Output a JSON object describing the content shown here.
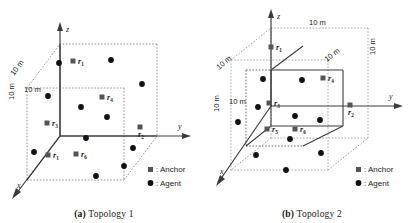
{
  "figure": {
    "panels": [
      {
        "id": "a",
        "caption_tag": "(a)",
        "caption_text": "Topology 1",
        "axes": {
          "x": "x",
          "y": "y",
          "z": "z"
        },
        "dimension_labels": [
          "10 m",
          "10 m",
          "10 m"
        ],
        "legend": {
          "anchor_label": ": Anchor",
          "agent_label": ": Agent"
        },
        "anchors": [
          {
            "name": "r",
            "sub": "1",
            "x": 74,
            "y": 62
          },
          {
            "name": "r",
            "sub": "2",
            "x": 141,
            "y": 128
          },
          {
            "name": "r",
            "sub": "3",
            "x": 48,
            "y": 124
          },
          {
            "name": "r",
            "sub": "4",
            "x": 103,
            "y": 98
          },
          {
            "name": "r",
            "sub": "6",
            "x": 77,
            "y": 155
          },
          {
            "name": "r",
            "sub": "1",
            "x": 49,
            "y": 156
          }
        ],
        "agents": [
          {
            "x": 59,
            "y": 63
          },
          {
            "x": 111,
            "y": 60
          },
          {
            "x": 142,
            "y": 84
          },
          {
            "x": 48,
            "y": 96
          },
          {
            "x": 81,
            "y": 107
          },
          {
            "x": 107,
            "y": 117
          },
          {
            "x": 86,
            "y": 138
          },
          {
            "x": 133,
            "y": 148
          },
          {
            "x": 34,
            "y": 152
          },
          {
            "x": 124,
            "y": 166
          },
          {
            "x": 96,
            "y": 176
          }
        ]
      },
      {
        "id": "b",
        "caption_tag": "(b)",
        "caption_text": "Topology 2",
        "axes": {
          "x": "x",
          "y": "y",
          "z": "z"
        },
        "dimension_labels": [
          "10 m",
          "10 m",
          "10 m",
          "10 m",
          "10 m",
          "10 m"
        ],
        "legend": {
          "anchor_label": ": Anchor",
          "agent_label": ": Agent"
        },
        "anchors": [
          {
            "name": "r",
            "sub": "1",
            "x": 79,
            "y": 48
          },
          {
            "name": "r",
            "sub": "2",
            "x": 143,
            "y": 106
          },
          {
            "name": "r",
            "sub": "3",
            "x": 62,
            "y": 104
          },
          {
            "name": "r",
            "sub": "4",
            "x": 116,
            "y": 79
          },
          {
            "name": "r",
            "sub": "5",
            "x": 60,
            "y": 130
          },
          {
            "name": "r",
            "sub": "6",
            "x": 88,
            "y": 130
          }
        ],
        "agents": [
          {
            "x": 55,
            "y": 79
          },
          {
            "x": 94,
            "y": 80
          },
          {
            "x": 50,
            "y": 107
          },
          {
            "x": 30,
            "y": 122
          },
          {
            "x": 87,
            "y": 116
          },
          {
            "x": 112,
            "y": 120
          },
          {
            "x": 82,
            "y": 139
          },
          {
            "x": 48,
            "y": 155
          },
          {
            "x": 113,
            "y": 153
          },
          {
            "x": 78,
            "y": 170
          }
        ]
      }
    ]
  },
  "style": {
    "anchor_color": "#555555",
    "agent_color": "#111111",
    "line_color": "#3c3c3c",
    "dashed_color": "#8a8a8a",
    "background": "#ffffff"
  }
}
